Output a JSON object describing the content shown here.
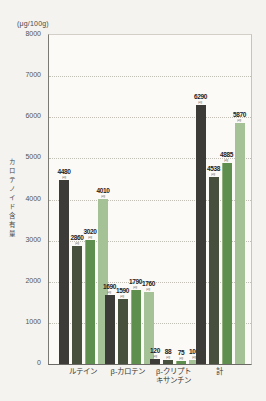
{
  "chart_data": {
    "type": "bar",
    "title": "",
    "unit_label": "(μg/100g)",
    "ylabel": "カロテノイド含有量",
    "xlabel": "",
    "ylim": [
      0,
      8000
    ],
    "ytick_interval": 1000,
    "grid": "horizontal-dotted",
    "legend_position": "none",
    "categories": [
      "ルテイン",
      "β-カロテン",
      "β-クリプト\nキサンチン",
      "計"
    ],
    "series": [
      {
        "color": "#3c3b37",
        "values": [
          4480,
          1690,
          120,
          6290
        ]
      },
      {
        "color": "#474f3d",
        "values": [
          2860,
          1590,
          88,
          4538
        ]
      },
      {
        "color": "#5f8f4e",
        "values": [
          3020,
          1790,
          75,
          4885
        ]
      },
      {
        "color": "#a5c296",
        "values": [
          4010,
          1760,
          100,
          5870
        ]
      }
    ],
    "bar_value_labels": true,
    "value_note_mark": "μg"
  }
}
